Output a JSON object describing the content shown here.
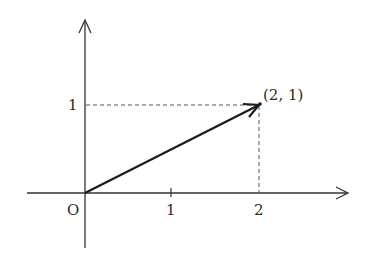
{
  "diagram": {
    "type": "vector-on-coordinate-plane",
    "origin_label": "O",
    "x_axis": {
      "ticks": [
        {
          "value": 1,
          "label": "1"
        },
        {
          "value": 2,
          "label": "2"
        }
      ]
    },
    "y_axis": {
      "ticks": [
        {
          "value": 1,
          "label": "1"
        }
      ]
    },
    "vector": {
      "from": [
        0,
        0
      ],
      "to": [
        2,
        1
      ]
    },
    "point_label": "(2, 1)",
    "colors": {
      "axis": "#333333",
      "vector": "#1a1a1a",
      "dashed": "#555555",
      "background": "#ffffff"
    }
  }
}
